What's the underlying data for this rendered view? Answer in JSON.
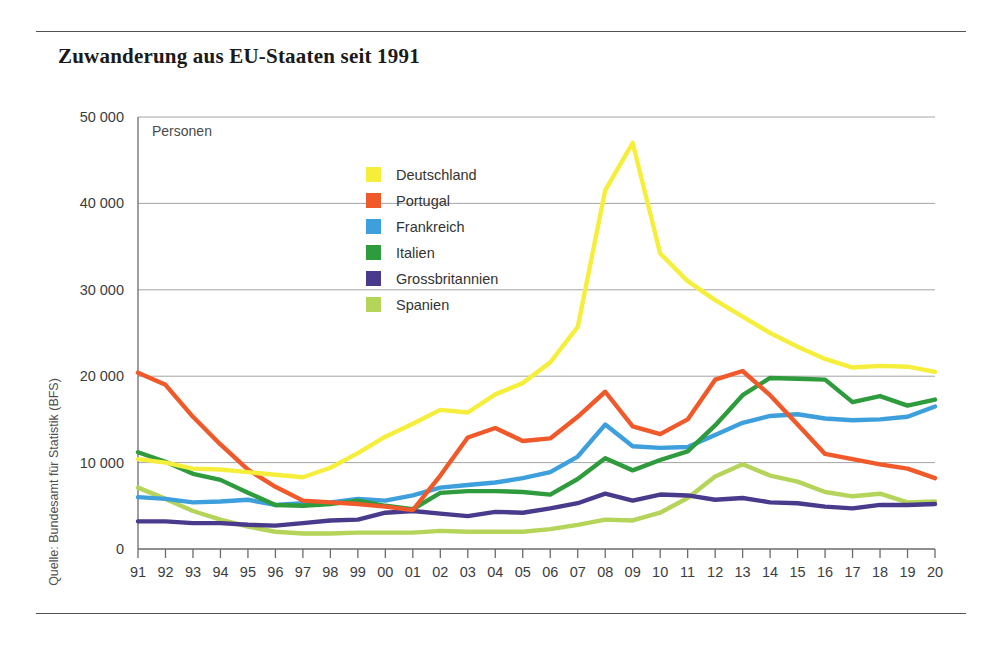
{
  "title": "Zuwanderung aus EU-Staaten seit 1991",
  "source": "Quelle: Bundesamt für Statistik (BFS)",
  "chart_data": {
    "type": "line",
    "title": "Zuwanderung aus EU-Staaten seit 1991",
    "unit_label": "Personen",
    "xlabel": "",
    "ylabel": "Personen",
    "ylim": [
      0,
      50000
    ],
    "yticks": [
      0,
      10000,
      20000,
      30000,
      40000,
      50000
    ],
    "ytick_labels": [
      "0",
      "10 000",
      "20 000",
      "30 000",
      "40 000",
      "50 000"
    ],
    "grid": true,
    "legend_position": "inside-top-left",
    "categories": [
      "91",
      "92",
      "93",
      "94",
      "95",
      "96",
      "97",
      "98",
      "99",
      "00",
      "01",
      "02",
      "03",
      "04",
      "05",
      "06",
      "07",
      "08",
      "09",
      "10",
      "11",
      "12",
      "13",
      "14",
      "15",
      "16",
      "17",
      "18",
      "19",
      "20"
    ],
    "x_full_years": [
      1991,
      1992,
      1993,
      1994,
      1995,
      1996,
      1997,
      1998,
      1999,
      2000,
      2001,
      2002,
      2003,
      2004,
      2005,
      2006,
      2007,
      2008,
      2009,
      2010,
      2011,
      2012,
      2013,
      2014,
      2015,
      2016,
      2017,
      2018,
      2019,
      2020
    ],
    "series": [
      {
        "name": "Deutschland",
        "color": "#F5EF3C",
        "values": [
          10400,
          10000,
          9300,
          9200,
          8900,
          8600,
          8300,
          9400,
          11100,
          13000,
          14500,
          16100,
          15800,
          17900,
          19200,
          21600,
          25700,
          41500,
          47000,
          34200,
          31000,
          28800,
          26900,
          25000,
          23400,
          22000,
          21000,
          21200,
          21100,
          20500
        ]
      },
      {
        "name": "Portugal",
        "color": "#F0592A",
        "values": [
          20400,
          19000,
          15300,
          12100,
          9200,
          7200,
          5600,
          5400,
          5200,
          4900,
          4500,
          8500,
          12900,
          14000,
          12500,
          12800,
          15300,
          18200,
          14200,
          13300,
          15000,
          19600,
          20600,
          17800,
          14400,
          11000,
          10400,
          9800,
          9300,
          8200
        ]
      },
      {
        "name": "Frankreich",
        "color": "#3E9FDD",
        "values": [
          6000,
          5800,
          5400,
          5500,
          5700,
          5100,
          5300,
          5400,
          5800,
          5600,
          6200,
          7100,
          7400,
          7700,
          8200,
          8900,
          10700,
          14400,
          11900,
          11700,
          11800,
          13200,
          14600,
          15400,
          15600,
          15100,
          14900,
          15000,
          15300,
          16500
        ]
      },
      {
        "name": "Italien",
        "color": "#2E9B3C",
        "values": [
          11200,
          10100,
          8700,
          8000,
          6500,
          5100,
          5000,
          5200,
          5600,
          5000,
          4600,
          6500,
          6700,
          6700,
          6600,
          6300,
          8100,
          10500,
          9100,
          10300,
          11300,
          14300,
          17800,
          19800,
          19700,
          19600,
          17000,
          17700,
          16600,
          17300
        ]
      },
      {
        "name": "Grossbritannien",
        "color": "#4A3A8C",
        "values": [
          3200,
          3200,
          3000,
          3000,
          2800,
          2700,
          3000,
          3300,
          3400,
          4200,
          4400,
          4100,
          3800,
          4300,
          4200,
          4700,
          5300,
          6400,
          5600,
          6300,
          6200,
          5700,
          5900,
          5400,
          5300,
          4900,
          4700,
          5100,
          5100,
          5200
        ]
      },
      {
        "name": "Spanien",
        "color": "#B4D45A",
        "values": [
          7100,
          5800,
          4400,
          3400,
          2600,
          2000,
          1800,
          1800,
          1900,
          1900,
          1900,
          2100,
          2000,
          2000,
          2000,
          2300,
          2800,
          3400,
          3300,
          4200,
          5900,
          8400,
          9800,
          8500,
          7800,
          6600,
          6100,
          6400,
          5400,
          5500
        ]
      }
    ]
  }
}
